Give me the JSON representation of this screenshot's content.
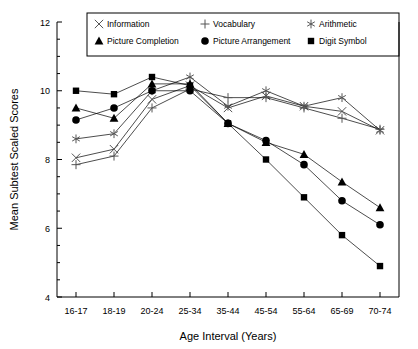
{
  "chart_data": {
    "type": "line",
    "title": "",
    "xlabel": "Age Interval (Years)",
    "ylabel": "Mean Subtest Scaled Scores",
    "categories": [
      "16-17",
      "18-19",
      "20-24",
      "25-34",
      "35-44",
      "45-54",
      "55-64",
      "65-69",
      "70-74"
    ],
    "ylim": [
      4,
      12
    ],
    "yticks": [
      4,
      6,
      8,
      10,
      12
    ],
    "ytick_labels": [
      "4",
      "6",
      "8",
      "10",
      "12"
    ],
    "minor_tick_step": 0.5,
    "grid": false,
    "legend_position": "top-inside",
    "series": [
      {
        "name": "Information",
        "marker": "x-cross",
        "values": [
          8.05,
          8.3,
          9.75,
          10.15,
          9.5,
          9.85,
          9.55,
          9.4,
          8.85
        ]
      },
      {
        "name": "Vocabulary",
        "marker": "plus",
        "values": [
          7.85,
          8.1,
          9.5,
          10.05,
          9.8,
          9.8,
          9.5,
          9.2,
          8.88
        ]
      },
      {
        "name": "Arithmetic",
        "marker": "asterisk",
        "values": [
          8.6,
          8.75,
          10.0,
          10.4,
          9.55,
          10.0,
          9.55,
          9.8,
          8.85
        ]
      },
      {
        "name": "Picture Completion",
        "marker": "triangle",
        "values": [
          9.5,
          9.2,
          10.2,
          10.2,
          9.05,
          8.5,
          8.15,
          7.35,
          6.6
        ]
      },
      {
        "name": "Picture Arrangement",
        "marker": "circle",
        "values": [
          9.15,
          9.5,
          10.0,
          10.0,
          9.05,
          8.55,
          7.85,
          6.8,
          6.1
        ]
      },
      {
        "name": "Digit Symbol",
        "marker": "square",
        "values": [
          10.0,
          9.9,
          10.4,
          10.15,
          9.05,
          8.0,
          6.9,
          5.8,
          4.9
        ]
      }
    ],
    "colors": {
      "ink": "#000000",
      "background": "#ffffff"
    }
  },
  "legend": {
    "items": [
      {
        "label": "Information",
        "marker": "x-cross"
      },
      {
        "label": "Vocabulary",
        "marker": "plus"
      },
      {
        "label": "Arithmetic",
        "marker": "asterisk"
      },
      {
        "label": "Picture Completion",
        "marker": "triangle"
      },
      {
        "label": "Picture Arrangement",
        "marker": "circle"
      },
      {
        "label": "Digit Symbol",
        "marker": "square"
      }
    ]
  }
}
